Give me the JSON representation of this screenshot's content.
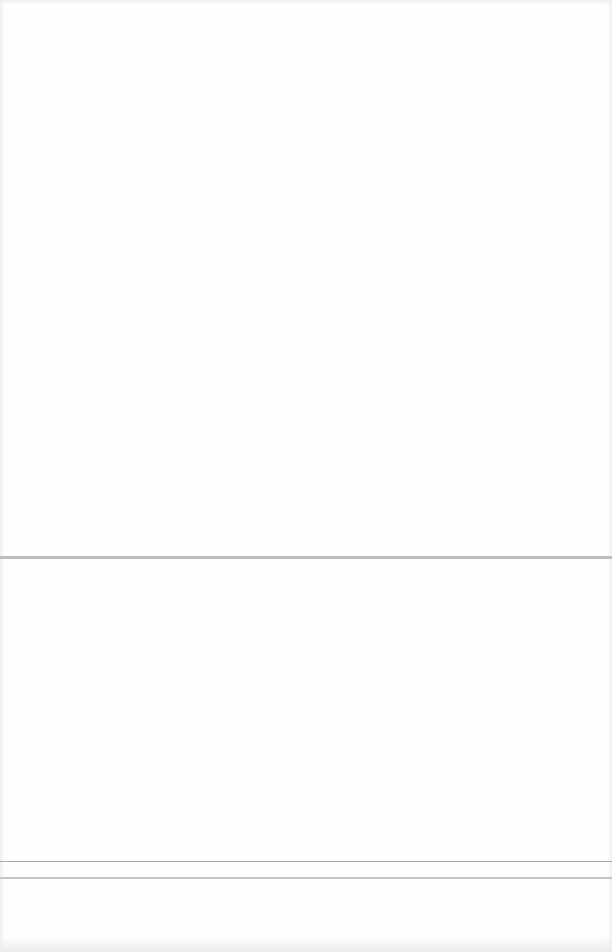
{
  "document": {
    "type": "blank scanned page",
    "visible_text": [],
    "rules": [
      {
        "name": "section-divider-upper",
        "color": "#bdbdbd"
      },
      {
        "name": "section-divider-lower-a",
        "color": "#aaaaaa"
      },
      {
        "name": "section-divider-lower-b",
        "color": "#c4c4c4"
      }
    ],
    "colors": {
      "paper": "#fefefe",
      "edge_shadow": "#e4e4e4",
      "bleed_through": "#f2f2f2"
    },
    "bleed_through_text": {
      "upper": "",
      "middle": "",
      "lower": ""
    }
  }
}
